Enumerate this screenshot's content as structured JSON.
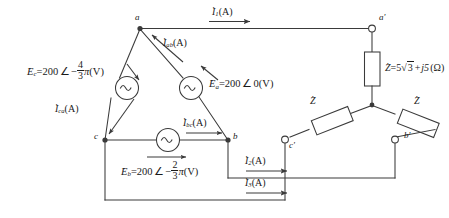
{
  "diagram": {
    "colors": {
      "line": "#3a3a3a",
      "text": "#1a1a1a",
      "background": "#ffffff"
    },
    "nodes": {
      "a": "a",
      "b": "b",
      "c": "c",
      "a_prime": "a'",
      "b_prime": "b'",
      "c_prime": "c'"
    },
    "sources": {
      "ea": {
        "symbol": "E",
        "sub": "a",
        "magnitude": "200",
        "angle_sign": "",
        "angle": "0",
        "unit": "(V)",
        "full": "Ea = 200 ∠ 0 (V)"
      },
      "eb": {
        "symbol": "E",
        "sub": "b",
        "magnitude": "200",
        "angle_sign": "−",
        "angle_num": "2",
        "angle_den": "3",
        "angle_pi": "π",
        "unit": "(V)",
        "full": "Eb = 200 ∠ −2π/3 (V)"
      },
      "ec": {
        "symbol": "E",
        "sub": "c",
        "magnitude": "200",
        "angle_sign": "−",
        "angle_num": "4",
        "angle_den": "3",
        "angle_pi": "π",
        "unit": "(V)",
        "full": "Ec = 200 ∠ −4π/3 (V)"
      }
    },
    "impedance": {
      "symbol": "Z",
      "real": "5",
      "radical": "3",
      "imag_sign": "+",
      "imag": "j5",
      "unit": "(Ω)",
      "full": "Z = 5√3 + j5 (Ω)",
      "short_label": "Z"
    },
    "currents": {
      "i1": {
        "symbol": "I",
        "sub": "1",
        "unit": "(A)",
        "full": "I1 (A)"
      },
      "i2": {
        "symbol": "I",
        "sub": "2",
        "unit": "(A)",
        "full": "I2 (A)"
      },
      "i3": {
        "symbol": "I",
        "sub": "3",
        "unit": "(A)",
        "full": "I3 (A)"
      },
      "iab": {
        "symbol": "I",
        "sub": "ab",
        "unit": "(A)",
        "full": "Iab (A)"
      },
      "ibc": {
        "symbol": "I",
        "sub": "bc",
        "unit": "(A)",
        "full": "Ibc (A)"
      },
      "ica": {
        "symbol": "I",
        "sub": "ca",
        "unit": "(A)",
        "full": "Ica (A)"
      }
    },
    "symbols": {
      "angle": "∠",
      "equals": "=",
      "dot": "·",
      "plus": "+",
      "minus": "−",
      "pi": "π",
      "ac_source": "~"
    }
  }
}
